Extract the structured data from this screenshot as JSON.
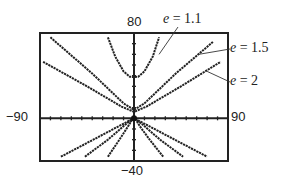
{
  "chart_data": {
    "type": "line",
    "title": "",
    "xlabel": "",
    "ylabel": "",
    "xlim": [
      -90,
      90
    ],
    "ylim": [
      -40,
      80
    ],
    "grid": false,
    "axis_ticks": {
      "x_step": 10,
      "y_step": 10
    },
    "window_labels": {
      "ymax": "80",
      "ymin": "−40",
      "xmin": "−90",
      "xmax": "90"
    },
    "series": [
      {
        "name": "e = 1.1",
        "label_var": "e",
        "label_value": "1.1",
        "branches": [
          [
            [
              -25,
              76
            ],
            [
              -18,
              58
            ],
            [
              -10,
              44
            ],
            [
              -4,
              39
            ],
            [
              0,
              38.7
            ],
            [
              4,
              39
            ],
            [
              10,
              44
            ],
            [
              18,
              58
            ],
            [
              24,
              76
            ]
          ],
          [
            [
              -25,
              -36
            ],
            [
              -14,
              -20
            ],
            [
              -6,
              -8
            ],
            [
              -1,
              0
            ],
            [
              0,
              2
            ],
            [
              1,
              0
            ],
            [
              6,
              -8
            ],
            [
              15,
              -20
            ],
            [
              28,
              -36
            ]
          ]
        ]
      },
      {
        "name": "e = 1.5",
        "label_var": "e",
        "label_value": "1.5",
        "branches": [
          [
            [
              -80,
              76
            ],
            [
              -40,
              42
            ],
            [
              -10,
              14
            ],
            [
              0,
              8
            ],
            [
              10,
              14
            ],
            [
              40,
              42
            ],
            [
              76,
              72
            ]
          ],
          [
            [
              -47,
              -36
            ],
            [
              -25,
              -20
            ],
            [
              -6,
              -4
            ],
            [
              0,
              0
            ],
            [
              6,
              -4
            ],
            [
              25,
              -20
            ],
            [
              47,
              -36
            ]
          ]
        ]
      },
      {
        "name": "e = 2",
        "label_var": "e",
        "label_value": "2",
        "branches": [
          [
            [
              -87,
              53
            ],
            [
              -45,
              30
            ],
            [
              -12,
              11
            ],
            [
              0,
              6
            ],
            [
              12,
              11
            ],
            [
              45,
              30
            ],
            [
              83,
              53
            ]
          ],
          [
            [
              -70,
              -36
            ],
            [
              -35,
              -18
            ],
            [
              -8,
              -4
            ],
            [
              0,
              0
            ],
            [
              8,
              -4
            ],
            [
              35,
              -18
            ],
            [
              70,
              -36
            ]
          ]
        ]
      }
    ],
    "annotations": [
      {
        "text": "e = 1.1",
        "pointer_to": [
          24,
          60
        ]
      },
      {
        "text": "e = 1.5",
        "pointer_to": [
          62,
          60
        ]
      },
      {
        "text": "e = 2",
        "pointer_to": [
          70,
          44
        ]
      }
    ],
    "focus_point": [
      0,
      0
    ]
  },
  "labels": {
    "ymax": "80",
    "ymin": "−40",
    "xmin": "−90",
    "xmax": "90",
    "legend": [
      {
        "var": "e",
        "eq": " = 1.1"
      },
      {
        "var": "e",
        "eq": " = 1.5"
      },
      {
        "var": "e",
        "eq": " = 2"
      }
    ]
  }
}
